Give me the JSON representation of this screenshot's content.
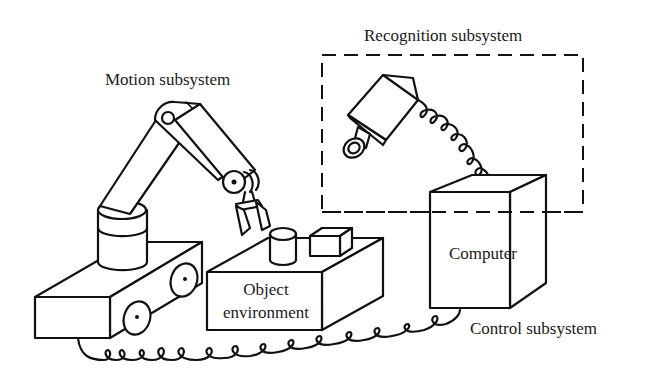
{
  "diagram": {
    "type": "system-block-illustration",
    "labels": {
      "motion": "Motion subsystem",
      "recognition": "Recognition subsystem",
      "control": "Control subsystem",
      "computer": "Computer",
      "object_line1": "Object",
      "object_line2": "environment"
    },
    "components": [
      {
        "id": "robot-arm",
        "subsystem": "Motion subsystem"
      },
      {
        "id": "mobile-cart",
        "subsystem": "Motion subsystem"
      },
      {
        "id": "camera",
        "subsystem": "Recognition subsystem"
      },
      {
        "id": "computer",
        "subsystem": "Control subsystem"
      },
      {
        "id": "object-environment",
        "contains": [
          "cylinder",
          "block"
        ]
      }
    ],
    "connections": [
      {
        "from": "camera",
        "to": "computer",
        "style": "coiled-cable"
      },
      {
        "from": "mobile-cart",
        "to": "computer",
        "style": "coiled-cable"
      }
    ],
    "colors": {
      "line": "#111111",
      "background": "#ffffff"
    }
  }
}
